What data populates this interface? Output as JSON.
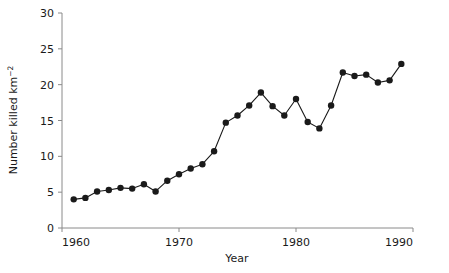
{
  "chart_data": {
    "type": "line",
    "title": "",
    "xlabel": "Year",
    "ylabel": "Number killed km",
    "ylabel_superscript": "−2",
    "x": [
      1961,
      1962,
      1963,
      1964,
      1965,
      1966,
      1967,
      1968,
      1969,
      1970,
      1971,
      1972,
      1973,
      1974,
      1975,
      1976,
      1977,
      1978,
      1979,
      1980,
      1981,
      1982,
      1983,
      1984,
      1985,
      1986,
      1987,
      1988,
      1989
    ],
    "values": [
      4.0,
      4.2,
      5.1,
      5.3,
      5.6,
      5.5,
      6.1,
      5.1,
      6.6,
      7.5,
      8.3,
      8.9,
      10.7,
      14.7,
      15.7,
      17.1,
      18.9,
      17.0,
      15.7,
      18.0,
      14.8,
      13.9,
      17.1,
      21.7,
      21.2,
      21.4,
      20.3,
      20.6,
      22.9
    ],
    "xlim": [
      1960,
      1990
    ],
    "ylim": [
      0,
      30
    ],
    "xticks": [
      1960,
      1970,
      1980,
      1990
    ],
    "xticklabels": [
      "1960",
      "1970",
      "1980",
      "1990"
    ],
    "yticks": [
      0,
      5,
      10,
      15,
      20,
      25,
      30
    ],
    "yticklabels": [
      "0",
      "5",
      "10",
      "15",
      "20",
      "25",
      "30"
    ],
    "grid": false,
    "legend": null,
    "marker": "filled-circle",
    "line_color": "#1a1a1a",
    "marker_color": "#1a1a1a",
    "axis_color": "#8a8a8a",
    "background": "#ffffff"
  }
}
